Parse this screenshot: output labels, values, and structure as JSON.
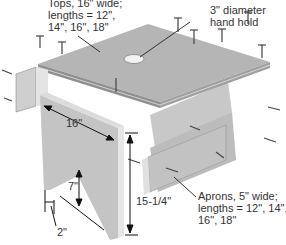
{
  "figure": {
    "callouts": {
      "tops": [
        "Tops, 16\" wide;",
        "lengths = 12\",",
        "14\", 16\", 18\""
      ],
      "hand_hold": [
        "3\" diameter",
        "hand hold"
      ],
      "aprons": [
        "Aprons, 5\" wide;",
        "lengths = 12\", 14\",",
        "16\", 18\""
      ]
    },
    "dimensions": {
      "side_width": "16\"",
      "side_height": "15-1/4\"",
      "notch_height": "7\"",
      "foot_width": "2\""
    },
    "colors": {
      "wood_light": "#d9d9d9",
      "wood_mid": "#bdbdbd",
      "wood_dark": "#9a9a9a",
      "line": "#222222",
      "text": "#333333"
    }
  }
}
